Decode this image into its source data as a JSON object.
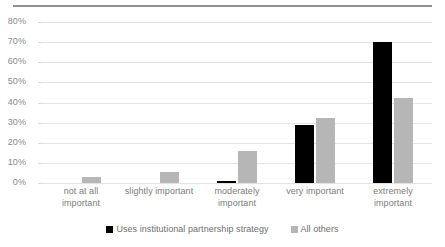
{
  "chart_data": {
    "type": "bar",
    "title": "",
    "subtitle": "",
    "xlabel": "",
    "ylabel": "",
    "ylim": [
      0,
      80
    ],
    "ytick_step": 10,
    "grid": true,
    "legend_position": "bottom",
    "categories": [
      "not at all important",
      "slightly important",
      "moderately important",
      "very important",
      "extremely important"
    ],
    "ytick_labels": [
      "0%",
      "10%",
      "20%",
      "30%",
      "40%",
      "50%",
      "60%",
      "70%",
      "80%"
    ],
    "series": [
      {
        "name": "Uses institutional partnership strategy",
        "color": "#000000",
        "values": [
          0,
          0,
          1,
          29,
          70
        ]
      },
      {
        "name": "All others",
        "color": "#b6b6b6",
        "values": [
          3,
          5.5,
          16,
          32.5,
          42
        ]
      }
    ]
  },
  "legend": {
    "entries": [
      {
        "label": "Uses institutional partnership strategy"
      },
      {
        "label": "All others"
      }
    ]
  }
}
